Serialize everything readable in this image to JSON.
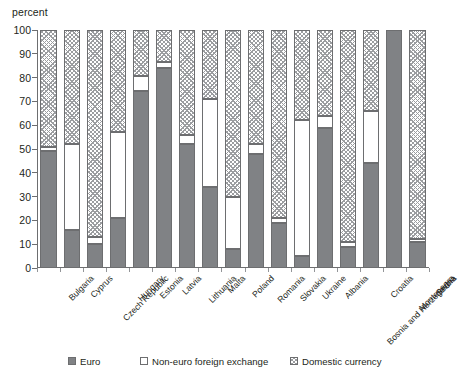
{
  "unit_label": "percent",
  "legend": {
    "items": [
      {
        "key": "euro",
        "label": "Euro",
        "swatch": "solid-gray-swatch"
      },
      {
        "key": "nonEuro",
        "label": "Non-euro foreign exchange",
        "swatch": "white-swatch"
      },
      {
        "key": "domestic",
        "label": "Domestic currency",
        "swatch": "hatched-swatch"
      }
    ]
  },
  "footnote": "",
  "colors": {
    "euro": "#808285",
    "non_euro": "#ffffff",
    "domestic": "#9b9da0",
    "axis": "#6d6e70",
    "text": "#231f20"
  },
  "chart_data": {
    "type": "bar",
    "title": "",
    "subtitle": "",
    "xlabel": "",
    "ylabel": "percent",
    "ylim": [
      0,
      100
    ],
    "yticks": [
      0,
      10,
      20,
      30,
      40,
      50,
      60,
      70,
      80,
      90,
      100
    ],
    "grid": false,
    "stacked": true,
    "legend_position": "bottom",
    "categories": [
      "Bulgaria",
      "Cyprus",
      "Czech Republic",
      "Hungary",
      "Estonia",
      "Latvia",
      "Lithuania",
      "Malta",
      "Poland",
      "Romania",
      "Slovakia",
      "Ukraine",
      "Albania",
      "Bosnia and Herzegovina",
      "Croatia",
      "Montenegro",
      "Serbia"
    ],
    "series": [
      {
        "name": "Euro",
        "values": [
          49,
          16,
          10,
          21,
          74.5,
          84,
          52,
          34,
          8,
          48,
          19,
          5,
          59,
          9,
          44,
          100,
          11
        ]
      },
      {
        "name": "Non-euro foreign exchange",
        "values": [
          2,
          36,
          3,
          36,
          6,
          2.5,
          4,
          37,
          22,
          4,
          2,
          57,
          5,
          2,
          22,
          0,
          1
        ]
      },
      {
        "name": "Domestic currency",
        "values": [
          49,
          48,
          87,
          43,
          19.5,
          13.5,
          44,
          29,
          70,
          48,
          79,
          38,
          36,
          89,
          34,
          0,
          88
        ]
      }
    ]
  }
}
